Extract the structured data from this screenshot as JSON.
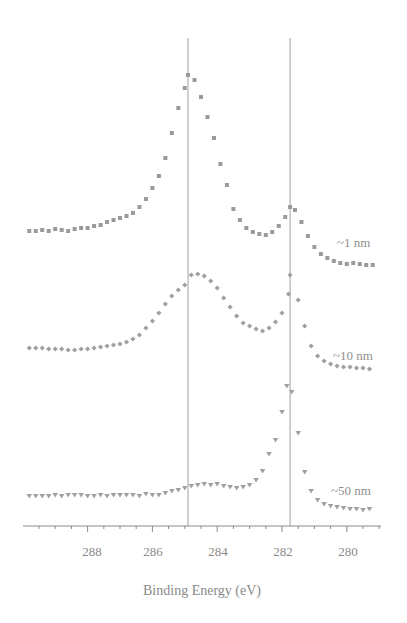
{
  "chart_data": {
    "type": "scatter",
    "title": "",
    "xlabel": "Binding Energy (eV)",
    "ylabel": "",
    "x_reversed": true,
    "xlim": [
      289.9,
      279.0
    ],
    "xticks": [
      288,
      286,
      284,
      282,
      280
    ],
    "x_minor_step": 0.5,
    "grid": false,
    "legend": "inline labels at right of each trace",
    "reference_lines_x": [
      284.9,
      281.75
    ],
    "offset_traces": true,
    "series": [
      {
        "name": "~1 nm",
        "marker": "square",
        "color": "#9a9a9a",
        "label_y_px": 243,
        "points_px_y_at_energy": [
          [
            289.8,
            231
          ],
          [
            289.6,
            231
          ],
          [
            289.4,
            230
          ],
          [
            289.2,
            231
          ],
          [
            289.0,
            229
          ],
          [
            288.8,
            230
          ],
          [
            288.6,
            231
          ],
          [
            288.4,
            229
          ],
          [
            288.2,
            228
          ],
          [
            288.0,
            228
          ],
          [
            287.8,
            226
          ],
          [
            287.6,
            225
          ],
          [
            287.4,
            222
          ],
          [
            287.2,
            220
          ],
          [
            287.0,
            218
          ],
          [
            286.8,
            216
          ],
          [
            286.6,
            213
          ],
          [
            286.4,
            207
          ],
          [
            286.2,
            199
          ],
          [
            286.0,
            188
          ],
          [
            285.8,
            176
          ],
          [
            285.6,
            158
          ],
          [
            285.4,
            133
          ],
          [
            285.2,
            108
          ],
          [
            285.0,
            88
          ],
          [
            284.9,
            75
          ],
          [
            284.7,
            80
          ],
          [
            284.5,
            97
          ],
          [
            284.3,
            117
          ],
          [
            284.1,
            138
          ],
          [
            283.9,
            164
          ],
          [
            283.7,
            185
          ],
          [
            283.5,
            209
          ],
          [
            283.3,
            220
          ],
          [
            283.1,
            228
          ],
          [
            282.9,
            232
          ],
          [
            282.7,
            234
          ],
          [
            282.5,
            235
          ],
          [
            282.3,
            232
          ],
          [
            282.1,
            226
          ],
          [
            281.9,
            217
          ],
          [
            281.75,
            207
          ],
          [
            281.6,
            210
          ],
          [
            281.4,
            222
          ],
          [
            281.2,
            236
          ],
          [
            281.0,
            247
          ],
          [
            280.8,
            254
          ],
          [
            280.6,
            258
          ],
          [
            280.4,
            261
          ],
          [
            280.2,
            263
          ],
          [
            280.0,
            264
          ],
          [
            279.8,
            263
          ],
          [
            279.6,
            264
          ],
          [
            279.4,
            265
          ],
          [
            279.2,
            265
          ]
        ]
      },
      {
        "name": "~10 nm",
        "marker": "diamond",
        "color": "#a0a0a0",
        "label_y_px": 356,
        "points_px_y_at_energy": [
          [
            289.8,
            348
          ],
          [
            289.6,
            348
          ],
          [
            289.4,
            348
          ],
          [
            289.2,
            349
          ],
          [
            289.0,
            349
          ],
          [
            288.8,
            349
          ],
          [
            288.6,
            350
          ],
          [
            288.4,
            350
          ],
          [
            288.2,
            349
          ],
          [
            288.0,
            349
          ],
          [
            287.8,
            348
          ],
          [
            287.6,
            347
          ],
          [
            287.4,
            346
          ],
          [
            287.2,
            345
          ],
          [
            287.0,
            344
          ],
          [
            286.8,
            342
          ],
          [
            286.6,
            339
          ],
          [
            286.4,
            335
          ],
          [
            286.2,
            328
          ],
          [
            286.0,
            321
          ],
          [
            285.8,
            313
          ],
          [
            285.6,
            304
          ],
          [
            285.4,
            296
          ],
          [
            285.2,
            290
          ],
          [
            285.0,
            285
          ],
          [
            284.8,
            275
          ],
          [
            284.6,
            274
          ],
          [
            284.4,
            276
          ],
          [
            284.2,
            281
          ],
          [
            284.0,
            288
          ],
          [
            283.8,
            298
          ],
          [
            283.6,
            307
          ],
          [
            283.4,
            316
          ],
          [
            283.2,
            323
          ],
          [
            283.0,
            326
          ],
          [
            282.8,
            329
          ],
          [
            282.6,
            331
          ],
          [
            282.4,
            328
          ],
          [
            282.2,
            322
          ],
          [
            282.0,
            313
          ],
          [
            281.8,
            294
          ],
          [
            281.75,
            275
          ],
          [
            281.5,
            300
          ],
          [
            281.3,
            326
          ],
          [
            281.1,
            346
          ],
          [
            280.9,
            356
          ],
          [
            280.7,
            361
          ],
          [
            280.5,
            364
          ],
          [
            280.3,
            366
          ],
          [
            280.1,
            367
          ],
          [
            279.9,
            367
          ],
          [
            279.7,
            368
          ],
          [
            279.5,
            368
          ],
          [
            279.3,
            369
          ]
        ]
      },
      {
        "name": "~50 nm",
        "marker": "triangle-down",
        "color": "#a0a0a0",
        "label_y_px": 491,
        "points_px_y_at_energy": [
          [
            289.8,
            496
          ],
          [
            289.6,
            496
          ],
          [
            289.4,
            496
          ],
          [
            289.2,
            496
          ],
          [
            289.0,
            495
          ],
          [
            288.8,
            496
          ],
          [
            288.6,
            495
          ],
          [
            288.4,
            495
          ],
          [
            288.2,
            495
          ],
          [
            288.0,
            496
          ],
          [
            287.8,
            496
          ],
          [
            287.6,
            495
          ],
          [
            287.4,
            496
          ],
          [
            287.2,
            495
          ],
          [
            287.0,
            495
          ],
          [
            286.8,
            495
          ],
          [
            286.6,
            495
          ],
          [
            286.4,
            496
          ],
          [
            286.2,
            494
          ],
          [
            286.0,
            495
          ],
          [
            285.8,
            495
          ],
          [
            285.6,
            493
          ],
          [
            285.4,
            491
          ],
          [
            285.2,
            490
          ],
          [
            285.0,
            488
          ],
          [
            284.8,
            486
          ],
          [
            284.6,
            485
          ],
          [
            284.4,
            484
          ],
          [
            284.2,
            485
          ],
          [
            284.0,
            484
          ],
          [
            283.8,
            486
          ],
          [
            283.6,
            487
          ],
          [
            283.4,
            488
          ],
          [
            283.2,
            487
          ],
          [
            283.0,
            485
          ],
          [
            282.8,
            480
          ],
          [
            282.6,
            471
          ],
          [
            282.4,
            454
          ],
          [
            282.2,
            440
          ],
          [
            282.0,
            412
          ],
          [
            281.85,
            386
          ],
          [
            281.7,
            392
          ],
          [
            281.5,
            433
          ],
          [
            281.3,
            472
          ],
          [
            281.1,
            491
          ],
          [
            280.9,
            500
          ],
          [
            280.7,
            504
          ],
          [
            280.5,
            506
          ],
          [
            280.3,
            507
          ],
          [
            280.1,
            508
          ],
          [
            279.9,
            509
          ],
          [
            279.7,
            509
          ],
          [
            279.5,
            510
          ],
          [
            279.3,
            509
          ]
        ]
      }
    ]
  },
  "axis": {
    "x_title": "Binding Energy (eV)",
    "tick_labels": [
      "288",
      "286",
      "284",
      "282",
      "280"
    ]
  },
  "labels": {
    "s1": "~1 nm",
    "s2": "~10 nm",
    "s3": "~50 nm"
  },
  "colors": {
    "axis": "#8a8a8a",
    "ref_line": "#b0b0b0",
    "marker": "#9c9c9c"
  }
}
